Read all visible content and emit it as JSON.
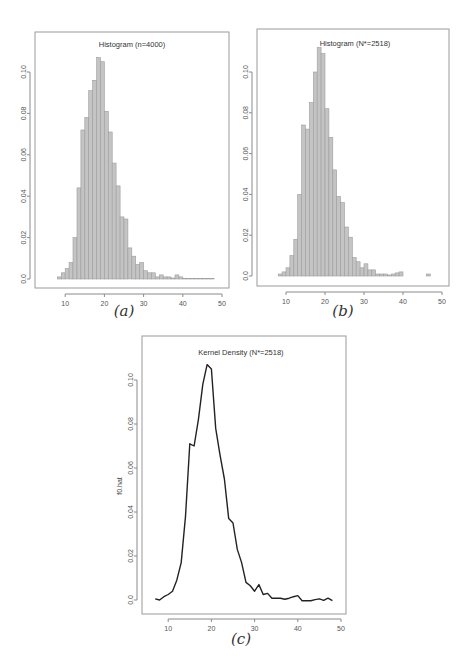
{
  "chart_data": [
    {
      "id": "a",
      "type": "bar",
      "title": "Histogram (n=4000)",
      "caption": "(a)",
      "xlabel": "",
      "ylabel": "",
      "xlim": [
        4,
        51
      ],
      "ylim": [
        0,
        0.115
      ],
      "x_ticks": [
        10,
        20,
        30,
        40,
        50
      ],
      "y_ticks": [
        0.0,
        0.02,
        0.04,
        0.06,
        0.08,
        0.1
      ],
      "y_tick_labels": [
        "0.0",
        "0.02",
        "0.04",
        "0.06",
        "0.08",
        "0.10"
      ],
      "bin_width": 1,
      "bin_starts": [
        8,
        9,
        10,
        11,
        12,
        13,
        14,
        15,
        16,
        17,
        18,
        19,
        20,
        21,
        22,
        23,
        24,
        25,
        26,
        27,
        28,
        29,
        30,
        31,
        32,
        33,
        34,
        35,
        36,
        37,
        38,
        39,
        40,
        41,
        42,
        43,
        44,
        45,
        46,
        47
      ],
      "values": [
        0.001,
        0.003,
        0.005,
        0.008,
        0.02,
        0.044,
        0.072,
        0.078,
        0.091,
        0.096,
        0.107,
        0.105,
        0.081,
        0.071,
        0.056,
        0.045,
        0.03,
        0.029,
        0.015,
        0.011,
        0.007,
        0.008,
        0.004,
        0.003,
        0.003,
        0.001,
        0.002,
        0.001,
        0.001,
        0.0005,
        0.002,
        0.001,
        0.0003,
        0.0002,
        0.0002,
        0.0003,
        0.0002,
        0.0002,
        0.0002,
        0.0002
      ],
      "grid": false
    },
    {
      "id": "b",
      "type": "bar",
      "title": "Histogram (N*=2518)",
      "caption": "(b)",
      "xlabel": "",
      "ylabel": "",
      "xlim": [
        4,
        51
      ],
      "ylim": [
        0,
        0.115
      ],
      "x_ticks": [
        10,
        20,
        30,
        40,
        50
      ],
      "y_ticks": [
        0.0,
        0.02,
        0.04,
        0.06,
        0.08,
        0.1
      ],
      "y_tick_labels": [
        "0.0",
        "0.02",
        "0.04",
        "0.06",
        "0.08",
        "0.10"
      ],
      "bin_width": 1,
      "bin_starts": [
        8,
        9,
        10,
        11,
        12,
        13,
        14,
        15,
        16,
        17,
        18,
        19,
        20,
        21,
        22,
        23,
        24,
        25,
        26,
        27,
        28,
        29,
        30,
        31,
        32,
        33,
        34,
        35,
        36,
        37,
        38,
        39,
        40,
        41,
        42,
        43,
        44,
        45,
        46,
        47
      ],
      "values": [
        0.001,
        0.002,
        0.004,
        0.01,
        0.018,
        0.04,
        0.074,
        0.072,
        0.085,
        0.1,
        0.112,
        0.109,
        0.082,
        0.068,
        0.052,
        0.039,
        0.036,
        0.024,
        0.019,
        0.009,
        0.007,
        0.004,
        0.006,
        0.003,
        0.003,
        0.001,
        0.001,
        0.001,
        0.0005,
        0.001,
        0.0015,
        0.002,
        0.0,
        0.0,
        0.0,
        0.0,
        0.0,
        0.0,
        0.001,
        0.0
      ],
      "grid": false
    },
    {
      "id": "c",
      "type": "line",
      "title": "Kernel Density (N*=2518)",
      "caption": "(c)",
      "xlabel": "",
      "ylabel": "f0.hat",
      "xlim": [
        4,
        51
      ],
      "ylim": [
        -0.004,
        0.114
      ],
      "x_ticks": [
        10,
        20,
        30,
        40,
        50
      ],
      "y_ticks": [
        0.0,
        0.02,
        0.04,
        0.06,
        0.08,
        0.1
      ],
      "y_tick_labels": [
        "0.0",
        "0.02",
        "0.04",
        "0.06",
        "0.08",
        "0.10"
      ],
      "x": [
        7,
        8,
        9,
        10,
        11,
        12,
        13,
        14,
        15,
        16,
        17,
        18,
        19,
        20,
        21,
        22,
        23,
        24,
        25,
        26,
        27,
        28,
        29,
        30,
        31,
        32,
        33,
        34,
        35,
        36,
        37,
        38,
        39,
        40,
        41,
        42,
        43,
        44,
        45,
        46,
        47,
        48
      ],
      "values": [
        0.0005,
        0.0,
        0.0015,
        0.0025,
        0.004,
        0.009,
        0.017,
        0.038,
        0.071,
        0.07,
        0.082,
        0.098,
        0.107,
        0.105,
        0.078,
        0.066,
        0.055,
        0.037,
        0.035,
        0.023,
        0.017,
        0.008,
        0.0065,
        0.004,
        0.007,
        0.0025,
        0.003,
        0.0008,
        0.0008,
        0.0008,
        0.0003,
        0.0008,
        0.0015,
        0.002,
        -0.0003,
        -0.0003,
        -0.0003,
        0.0002,
        0.0005,
        -0.0002,
        0.0008,
        -0.0003
      ],
      "grid": false
    }
  ]
}
